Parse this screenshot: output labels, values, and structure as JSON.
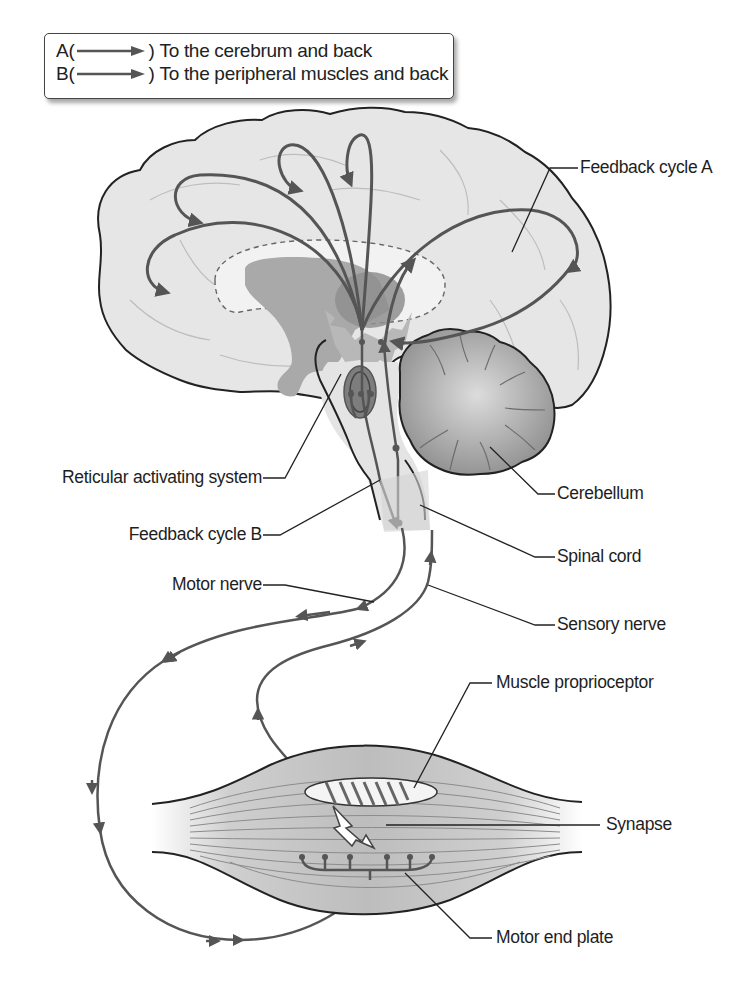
{
  "legend": {
    "rows": [
      {
        "key": "A",
        "open": "(",
        "close": ")",
        "text": "To the cerebrum and back",
        "arrow": "right-arrow"
      },
      {
        "key": "B",
        "open": "(",
        "close": ")",
        "text": "To the peripheral muscles and back",
        "arrow": "right-arrow"
      }
    ]
  },
  "labels": {
    "feedback_cycle_a": "Feedback cycle A",
    "reticular_activating_system": "Reticular activating system",
    "cerebellum": "Cerebellum",
    "feedback_cycle_b": "Feedback cycle B",
    "spinal_cord": "Spinal cord",
    "motor_nerve": "Motor nerve",
    "sensory_nerve": "Sensory nerve",
    "muscle_proprioceptor": "Muscle proprioceptor",
    "synapse": "Synapse",
    "motor_end_plate": "Motor end plate"
  },
  "colors": {
    "background": "#ffffff",
    "brain_fill": "#e6e6e6",
    "deep_structure_fill": "#a9a9a9",
    "cerebellum_fill": "#a8a8a8",
    "pathway_stroke": "#555555",
    "outline": "#222222",
    "muscle_fill": "#c8c8c8"
  }
}
